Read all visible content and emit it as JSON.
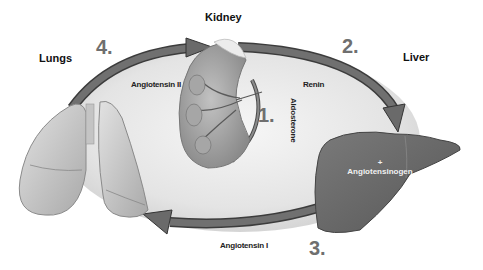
{
  "organs": {
    "kidney": "Kidney",
    "lungs": "Lungs",
    "liver": "Liver"
  },
  "hormones": {
    "angiotensin_ii": "Angiotensin II",
    "renin": "Renin",
    "aldosterone": "Aldosterone",
    "angiotensinogen_plus": "+",
    "angiotensinogen": "Angiotensinogen",
    "angiotensin_i": "Angiotensin I"
  },
  "steps": {
    "step1": "1.",
    "step2": "2.",
    "step3": "3.",
    "step4": "4."
  },
  "colors": {
    "arrow": "#6e6e6e",
    "arrow_dark": "#3c3c3c",
    "ellipse_fill": "#e2e2e2",
    "liver": "#6a6a6a",
    "lungs": "#c9c9c9",
    "kidney": "#9a9a9a",
    "step_number": "#6f6f6f"
  }
}
